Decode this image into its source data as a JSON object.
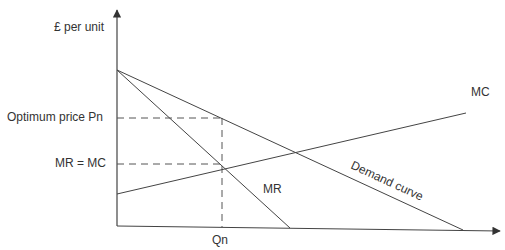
{
  "diagram": {
    "type": "monopoly profit maximisation (MR = MC)",
    "y_axis_label": "£ per unit",
    "x_axis_label": "Qn",
    "price_label": "Optimum price Pn",
    "mr_mc_label": "MR = MC",
    "curves": {
      "mc": "MC",
      "mr": "MR",
      "demand": "Demand curve"
    },
    "colors": {
      "line": "#444444",
      "dashed": "#555555",
      "text": "#333333"
    }
  }
}
